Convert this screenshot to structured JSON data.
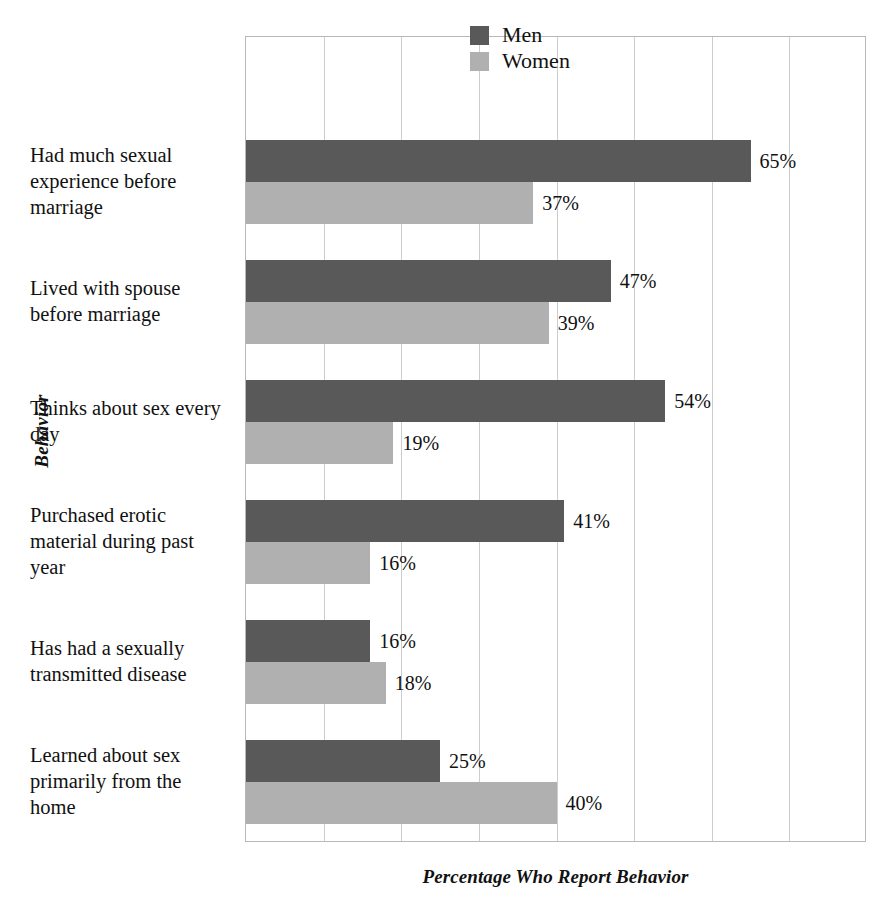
{
  "chart_data": {
    "type": "bar",
    "orientation": "horizontal",
    "title": "",
    "xlabel": "Percentage Who Report Behavior",
    "ylabel": "Behavior",
    "xlim": [
      0,
      80
    ],
    "xticks": [
      0,
      10,
      20,
      30,
      40,
      50,
      60,
      70,
      80
    ],
    "xtick_labels": [
      "",
      "",
      "",
      "",
      "",
      "",
      "",
      "",
      ""
    ],
    "grid": true,
    "legend_position": "top-right",
    "categories": [
      "Had much sexual experience before marriage",
      "Lived with spouse before marriage",
      "Thinks about sex every day",
      "Purchased erotic material during past year",
      "Has had a sexually transmitted disease",
      "Learned about sex primarily from the home"
    ],
    "series": [
      {
        "name": "Men",
        "color": "#595959",
        "values": [
          65,
          47,
          54,
          41,
          16,
          25
        ],
        "value_labels": [
          "65%",
          "47%",
          "54%",
          "41%",
          "16%",
          "25%"
        ]
      },
      {
        "name": "Women",
        "color": "#b0b0b0",
        "values": [
          37,
          39,
          19,
          16,
          18,
          40
        ],
        "value_labels": [
          "37%",
          "39%",
          "19%",
          "16%",
          "18%",
          "40%"
        ]
      }
    ]
  },
  "legend": {
    "items": [
      {
        "label": "Men",
        "swatch": "men-swatch"
      },
      {
        "label": "Women",
        "swatch": "women-swatch"
      }
    ]
  },
  "axis": {
    "y_title": "Behavior",
    "x_title": "Percentage Who Report Behavior"
  }
}
